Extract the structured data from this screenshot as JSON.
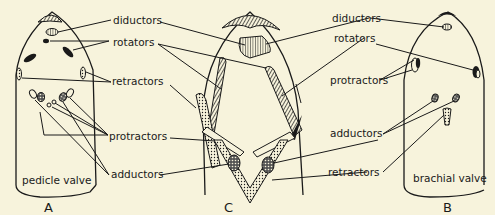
{
  "figure": {
    "background": "#f7f3dc",
    "ink": "#1a1a1a",
    "panels": [
      {
        "id": "A",
        "letter": "A",
        "caption": "pedicle valve"
      },
      {
        "id": "C",
        "letter": "C",
        "caption": ""
      },
      {
        "id": "B",
        "letter": "B",
        "caption": "brachial valve"
      }
    ],
    "labels": {
      "left": {
        "diductors": "diductors",
        "rotators": "rotators",
        "retractors": "retractors",
        "protractors": "protractors",
        "adductors": "adductors"
      },
      "right": {
        "diductors": "diductors",
        "rotators": "rotators",
        "protractors": "protractors",
        "adductors": "adductors",
        "retractors": "retractors"
      }
    }
  }
}
